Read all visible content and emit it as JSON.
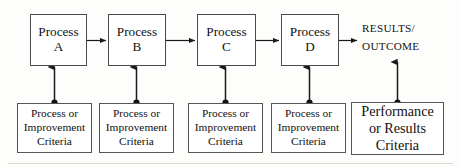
{
  "diagram": {
    "process_boxes": [
      {
        "line1": "Process",
        "line2": "A"
      },
      {
        "line1": "Process",
        "line2": "B"
      },
      {
        "line1": "Process",
        "line2": "C"
      },
      {
        "line1": "Process",
        "line2": "D"
      }
    ],
    "outcome": {
      "line1": "RESULTS/",
      "line2": "OUTCOME"
    },
    "criteria_boxes": [
      {
        "line1": "Process or",
        "line2": "Improvement",
        "line3": "Criteria"
      },
      {
        "line1": "Process or",
        "line2": "Improvement",
        "line3": "Criteria"
      },
      {
        "line1": "Process or",
        "line2": "Improvement",
        "line3": "Criteria"
      },
      {
        "line1": "Process or",
        "line2": "Improvement",
        "line3": "Criteria"
      },
      {
        "line1": "Performance",
        "line2": "or Results",
        "line3": "Criteria"
      }
    ],
    "colors": {
      "box_border": "#4a4a4a",
      "criteria_border": "#555555",
      "wire": "#1a1a1a",
      "background": "#fdfdfb",
      "text": "#111111"
    }
  }
}
